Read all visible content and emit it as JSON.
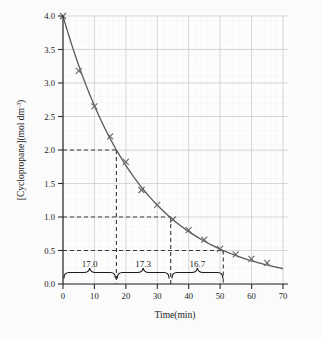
{
  "chart_data": {
    "type": "line",
    "title": "",
    "xlabel": "Time(min)",
    "ylabel": "[Cyclopropane](mol dm",
    "ylabel_sup": "-3",
    "ylabel_tail": ")",
    "xlim": [
      0,
      70
    ],
    "ylim": [
      0.0,
      4.0
    ],
    "grid": true,
    "grid_major_x": 10,
    "grid_major_y": 0.5,
    "grid_minor_divisions": 5,
    "legend": "none",
    "xticks": [
      "0",
      "10",
      "20",
      "30",
      "40",
      "50",
      "60",
      "70"
    ],
    "xtick_values": [
      0,
      10,
      20,
      30,
      40,
      50,
      60,
      70
    ],
    "yticks": [
      "0.0",
      "0.5",
      "1.0",
      "1.5",
      "2.0",
      "2.5",
      "3.0",
      "3.5",
      "4.0"
    ],
    "ytick_values": [
      0.0,
      0.5,
      1.0,
      1.5,
      2.0,
      2.5,
      3.0,
      3.5,
      4.0
    ],
    "series": [
      {
        "name": "[Cyclopropane]",
        "marker": "x",
        "color": "#5a5a5a",
        "x": [
          0,
          5,
          10,
          15,
          20,
          25,
          30,
          35,
          40,
          45,
          50,
          55,
          60,
          65
        ],
        "y": [
          4.0,
          3.18,
          2.65,
          2.2,
          1.82,
          1.4,
          1.18,
          0.96,
          0.8,
          0.66,
          0.5,
          0.42,
          0.35,
          0.29
        ]
      }
    ],
    "curve_model": {
      "type": "exponential_decay",
      "initial": 4.0,
      "half_life": 17.0
    },
    "construction_lines": [
      {
        "y": 2.0,
        "x": 17.0,
        "style": "dashed"
      },
      {
        "y": 1.0,
        "x": 34.3,
        "style": "dashed"
      },
      {
        "y": 0.5,
        "x": 51.0,
        "style": "dashed"
      }
    ],
    "annotations": [
      {
        "label": "17.0",
        "x_start": 0.0,
        "x_end": 17.0,
        "type": "half-life-brace"
      },
      {
        "label": "17.3",
        "x_start": 17.0,
        "x_end": 34.3,
        "type": "half-life-brace"
      },
      {
        "label": "16.7",
        "x_start": 34.3,
        "x_end": 51.0,
        "type": "half-life-brace"
      }
    ],
    "colors": {
      "background": "#fbfbfb",
      "grid_major": "#c3c9cf",
      "grid_minor": "#e3e7ea",
      "axis": "#2b2b2b",
      "curve": "#5a5a5a",
      "dashed": "#3a3a3a",
      "text": "#1a1a1a"
    }
  }
}
